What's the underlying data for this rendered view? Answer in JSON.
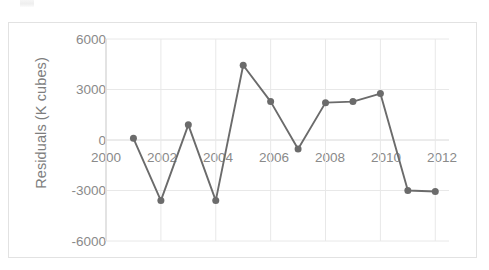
{
  "chart_data": {
    "type": "line",
    "title": "",
    "xlabel": "",
    "ylabel": "Residuals (K cubes)",
    "x": [
      2001,
      2002,
      2003,
      2004,
      2005,
      2006,
      2007,
      2008,
      2009,
      2010,
      2011,
      2012
    ],
    "values": [
      100,
      -3600,
      900,
      -3600,
      4440,
      2280,
      -540,
      2220,
      2280,
      2760,
      -3000,
      -3060
    ],
    "series": [
      {
        "name": "Residuals",
        "values": [
          100,
          -3600,
          900,
          -3600,
          4440,
          2280,
          -540,
          2220,
          2280,
          2760,
          -3000,
          -3060
        ]
      }
    ],
    "xlim": [
      2000,
      2012.5
    ],
    "ylim": [
      -6000,
      6000
    ],
    "y_ticks": [
      "6000",
      "3000",
      "0",
      "-3000",
      "-6000"
    ],
    "y_tick_values": [
      6000,
      3000,
      0,
      -3000,
      -6000
    ],
    "x_ticks": [
      "2000",
      "2002",
      "2004",
      "2006",
      "2008",
      "2010",
      "2012"
    ],
    "x_tick_values": [
      2000,
      2002,
      2004,
      2006,
      2008,
      2010,
      2012
    ],
    "grid": true,
    "legend": "none",
    "marker": "circle",
    "colors": {
      "line": "#6b6b6b",
      "marker": "#6b6b6b",
      "grid": "#e8e8e8",
      "axis": "#d8d8d8",
      "tick_label": "#8a8a8a",
      "axis_title": "#7e7e7e",
      "plot_border": "#e2e2e2",
      "background": "#ffffff"
    }
  },
  "axis": {
    "y_title": "Residuals (K cubes)",
    "y_ticks": [
      {
        "label": "6000"
      },
      {
        "label": "3000"
      },
      {
        "label": "0"
      },
      {
        "label": "-3000"
      },
      {
        "label": "-6000"
      }
    ],
    "x_ticks": [
      {
        "label": "2000"
      },
      {
        "label": "2002"
      },
      {
        "label": "2004"
      },
      {
        "label": "2006"
      },
      {
        "label": "2008"
      },
      {
        "label": "2010"
      },
      {
        "label": "2012"
      }
    ]
  }
}
